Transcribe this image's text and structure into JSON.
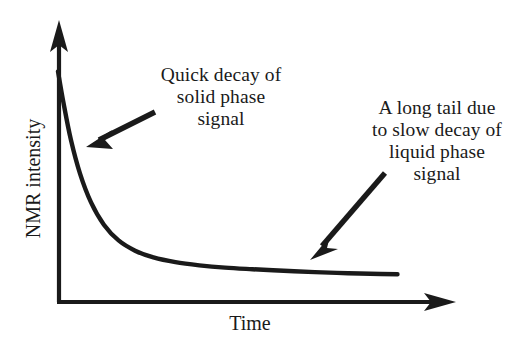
{
  "figure": {
    "background_color": "#ffffff",
    "ink_color": "#1a1a1a"
  },
  "axes": {
    "x_label": "Time",
    "y_label": "NMR intensity",
    "origin": {
      "x": 58,
      "y": 302
    },
    "x_axis_end": {
      "x": 455,
      "y": 302
    },
    "y_axis_end": {
      "x": 58,
      "y": 22
    },
    "arrowheads": [
      "x-axis-right",
      "y-axis-top"
    ],
    "ticks": "none",
    "tick_labels": "none",
    "gridlines": "none"
  },
  "annotations": [
    {
      "name": "solid-phase",
      "lines": [
        "Quick decay of",
        "solid phase",
        "signal"
      ],
      "arrow_from": {
        "x": 153,
        "y": 113
      },
      "arrow_to": {
        "x": 88,
        "y": 146
      }
    },
    {
      "name": "liquid-phase",
      "lines": [
        "A long tail due",
        "to slow decay of",
        "liquid phase",
        "signal"
      ],
      "arrow_from": {
        "x": 384,
        "y": 174
      },
      "arrow_to": {
        "x": 311,
        "y": 257
      }
    }
  ],
  "chart_data": {
    "type": "line",
    "title": "",
    "subtitle": "",
    "xlabel": "Time",
    "ylabel": "NMR intensity",
    "xlim": [
      0,
      1
    ],
    "ylim": [
      0,
      1
    ],
    "grid": false,
    "legend": "none",
    "series": [
      {
        "name": "NMR free induction decay",
        "description": "Bi-exponential decay: fast solid-phase decay followed by a long slow-decaying liquid-phase tail",
        "x": [
          0.0,
          0.015,
          0.035,
          0.06,
          0.09,
          0.125,
          0.165,
          0.21,
          0.26,
          0.32,
          0.385,
          0.455,
          0.53,
          0.615,
          0.7,
          0.79,
          0.88,
          0.925
        ],
        "y": [
          0.88,
          0.76,
          0.62,
          0.49,
          0.38,
          0.295,
          0.235,
          0.196,
          0.17,
          0.152,
          0.14,
          0.131,
          0.125,
          0.119,
          0.114,
          0.11,
          0.107,
          0.106
        ]
      }
    ],
    "annotations": [
      "Quick decay of solid phase signal",
      "A long tail due to slow decay of liquid phase signal"
    ]
  }
}
